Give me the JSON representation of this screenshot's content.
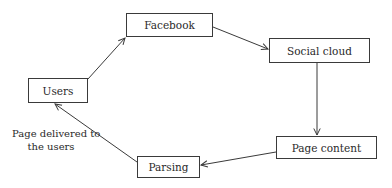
{
  "diagram": {
    "type": "flow-cycle",
    "nodes": [
      {
        "id": "facebook",
        "label": "Facebook",
        "x": 126,
        "y": 13,
        "w": 87,
        "h": 24
      },
      {
        "id": "social_cloud",
        "label": "Social cloud",
        "x": 269,
        "y": 38,
        "w": 101,
        "h": 25
      },
      {
        "id": "page_content",
        "label": "Page content",
        "x": 276,
        "y": 136,
        "w": 101,
        "h": 23
      },
      {
        "id": "parsing",
        "label": "Parsing",
        "x": 137,
        "y": 156,
        "w": 63,
        "h": 22
      },
      {
        "id": "users",
        "label": "Users",
        "x": 28,
        "y": 78,
        "w": 60,
        "h": 25
      }
    ],
    "edges": [
      {
        "from": "users",
        "to": "facebook",
        "label": ""
      },
      {
        "from": "facebook",
        "to": "social_cloud",
        "label": ""
      },
      {
        "from": "social_cloud",
        "to": "page_content",
        "label": ""
      },
      {
        "from": "page_content",
        "to": "parsing",
        "label": ""
      },
      {
        "from": "parsing",
        "to": "users",
        "label": "Page delivered to the users"
      }
    ],
    "edge_label": {
      "line1": "Page delivered to",
      "line2": "the users"
    },
    "colors": {
      "stroke": "#3a3a3a",
      "text": "#2a2a2a",
      "background": "#ffffff"
    }
  }
}
